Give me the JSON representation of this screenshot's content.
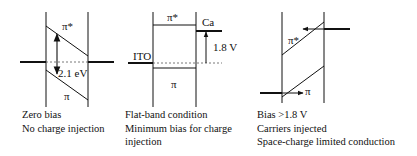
{
  "panels": [
    {
      "id": "zero-bias",
      "labels": {
        "lumo": "π*",
        "homo": "π",
        "gap": "2.1 eV"
      },
      "caption": [
        "Zero bias",
        "No charge injection"
      ]
    },
    {
      "id": "flat-band",
      "labels": {
        "lumo": "π*",
        "homo": "π",
        "anode": "ITO",
        "cathode": "Ca",
        "voltage": "1.8 V"
      },
      "caption": [
        "Flat-band condition",
        "Minimum bias for charge",
        "injection"
      ]
    },
    {
      "id": "forward-bias",
      "labels": {
        "lumo": "π*",
        "homo": "π"
      },
      "caption": [
        "Bias >1.8 V",
        "Carriers injected",
        "Space-charge limited conduction"
      ]
    }
  ],
  "colors": {
    "line": "#111111",
    "dashed": "#555555"
  }
}
